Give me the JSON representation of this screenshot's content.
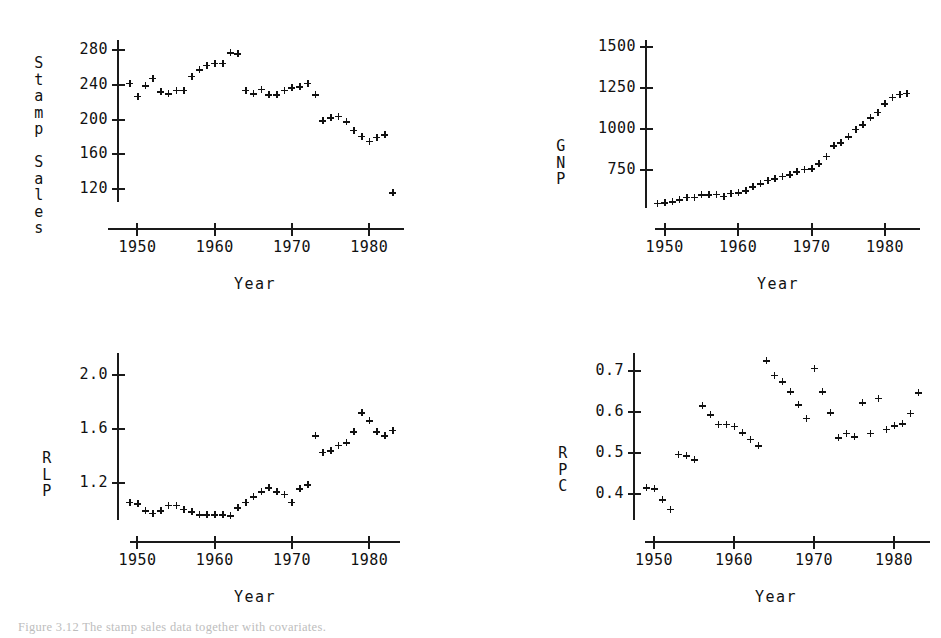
{
  "figure": {
    "caption": "Figure 3.12  The stamp sales data together with covariates.",
    "background_color": "#ffffff",
    "marker_color": "#111111",
    "axis_color": "#1a1a1a"
  },
  "chart_data": [
    {
      "id": "stamp-sales",
      "type": "scatter",
      "title": "",
      "xlabel": "Year",
      "ylabel": "Stamp Sales",
      "ylabel_chars": [
        "S",
        "t",
        "a",
        "m",
        "p",
        "",
        "S",
        "a",
        "l",
        "e",
        "s"
      ],
      "xlim": [
        1948.0,
        1984.5
      ],
      "ylim": [
        105,
        292
      ],
      "xticks": [
        1950,
        1960,
        1970,
        1980
      ],
      "xtick_labels": [
        "1950",
        "1960",
        "1970",
        "1980"
      ],
      "yticks": [
        120,
        160,
        200,
        240,
        280
      ],
      "ytick_labels": [
        "120",
        "160",
        "200",
        "240",
        "280"
      ],
      "grid": false,
      "legend": false,
      "x": [
        1949,
        1950,
        1951,
        1952,
        1953,
        1954,
        1955,
        1956,
        1957,
        1958,
        1959,
        1960,
        1961,
        1962,
        1963,
        1964,
        1965,
        1966,
        1967,
        1968,
        1969,
        1970,
        1971,
        1972,
        1973,
        1974,
        1975,
        1976,
        1977,
        1978,
        1979,
        1980,
        1981,
        1982,
        1983
      ],
      "y": [
        242,
        227,
        239,
        248,
        232,
        230,
        234,
        234,
        250,
        258,
        263,
        265,
        265,
        277,
        276,
        234,
        230,
        235,
        229,
        229,
        234,
        237,
        238,
        242,
        229,
        199,
        202,
        204,
        198,
        188,
        181,
        175,
        180,
        183,
        116
      ],
      "series_note": "one series, single marker style (plus)"
    },
    {
      "id": "gnp",
      "type": "scatter",
      "title": "",
      "xlabel": "Year",
      "ylabel": "GNP",
      "ylabel_chars": [
        "G",
        "N",
        "P"
      ],
      "xlim": [
        1948.0,
        1984.5
      ],
      "ylim": [
        520,
        1545
      ],
      "xticks": [
        1950,
        1960,
        1970,
        1980
      ],
      "xtick_labels": [
        "1950",
        "1960",
        "1970",
        "1980"
      ],
      "yticks": [
        750,
        1000,
        1250,
        1500
      ],
      "ytick_labels": [
        "750",
        "1000",
        "1250",
        "1500"
      ],
      "grid": false,
      "legend": false,
      "x": [
        1949,
        1950,
        1951,
        1952,
        1953,
        1954,
        1955,
        1956,
        1957,
        1958,
        1959,
        1960,
        1961,
        1962,
        1963,
        1964,
        1965,
        1966,
        1967,
        1968,
        1969,
        1970,
        1971,
        1972,
        1973,
        1974,
        1975,
        1976,
        1977,
        1978,
        1979,
        1980,
        1981,
        1982,
        1983
      ],
      "y": [
        550,
        552,
        560,
        570,
        585,
        585,
        600,
        600,
        603,
        592,
        610,
        612,
        625,
        650,
        668,
        690,
        700,
        715,
        722,
        740,
        757,
        760,
        790,
        835,
        900,
        920,
        955,
        1000,
        1030,
        1070,
        1105,
        1155,
        1195,
        1215,
        1220
      ]
    },
    {
      "id": "rlp",
      "type": "scatter",
      "title": "",
      "xlabel": "Year",
      "ylabel": "RLP",
      "ylabel_chars": [
        "R",
        "L",
        "P"
      ],
      "xlim": [
        1948.0,
        1984.5
      ],
      "ylim": [
        0.93,
        2.16
      ],
      "xticks": [
        1950,
        1960,
        1970,
        1980
      ],
      "xtick_labels": [
        "1950",
        "1960",
        "1970",
        "1980"
      ],
      "yticks": [
        1.2,
        1.6,
        2.0
      ],
      "ytick_labels": [
        "1.2",
        "1.6",
        "2.0"
      ],
      "grid": false,
      "legend": false,
      "x": [
        1949,
        1950,
        1951,
        1952,
        1953,
        1954,
        1955,
        1956,
        1957,
        1958,
        1959,
        1960,
        1961,
        1962,
        1963,
        1964,
        1965,
        1966,
        1967,
        1968,
        1969,
        1970,
        1971,
        1972,
        1973,
        1974,
        1975,
        1976,
        1977,
        1978,
        1979,
        1980,
        1981,
        1982,
        1983
      ],
      "y": [
        1.06,
        1.05,
        1.0,
        0.98,
        1.0,
        1.04,
        1.04,
        1.01,
        0.99,
        0.97,
        0.97,
        0.97,
        0.97,
        0.96,
        1.02,
        1.06,
        1.1,
        1.14,
        1.17,
        1.14,
        1.12,
        1.06,
        1.16,
        1.19,
        1.55,
        1.43,
        1.44,
        1.48,
        1.5,
        1.58,
        1.72,
        1.66,
        1.58,
        1.55,
        1.59
      ]
    },
    {
      "id": "rpc",
      "type": "scatter",
      "title": "",
      "xlabel": "Year",
      "ylabel": "RPC",
      "ylabel_chars": [
        "R",
        "P",
        "C"
      ],
      "xlim": [
        1948.0,
        1984.5
      ],
      "ylim": [
        0.335,
        0.745
      ],
      "xticks": [
        1950,
        1960,
        1970,
        1980
      ],
      "xtick_labels": [
        "1950",
        "1960",
        "1970",
        "1980"
      ],
      "yticks": [
        0.4,
        0.5,
        0.6,
        0.7
      ],
      "ytick_labels": [
        "0.4",
        "0.5",
        "0.6",
        "0.7"
      ],
      "grid": false,
      "legend": false,
      "x": [
        1949,
        1950,
        1951,
        1952,
        1953,
        1954,
        1955,
        1956,
        1957,
        1958,
        1959,
        1960,
        1961,
        1962,
        1963,
        1964,
        1965,
        1966,
        1967,
        1968,
        1969,
        1970,
        1971,
        1972,
        1973,
        1974,
        1975,
        1976,
        1977,
        1978,
        1979,
        1980,
        1981,
        1982,
        1983
      ],
      "y": [
        0.415,
        0.412,
        0.385,
        0.362,
        0.497,
        0.493,
        0.483,
        0.615,
        0.594,
        0.57,
        0.57,
        0.565,
        0.549,
        0.533,
        0.518,
        0.726,
        0.69,
        0.675,
        0.65,
        0.618,
        0.585,
        0.708,
        0.65,
        0.598,
        0.537,
        0.548,
        0.54,
        0.623,
        0.548,
        0.634,
        0.558,
        0.566,
        0.572,
        0.597,
        0.648
      ]
    }
  ],
  "panels": [
    {
      "id": "stamp-sales",
      "name": "stamp-sales-chart"
    },
    {
      "id": "gnp",
      "name": "gnp-chart"
    },
    {
      "id": "rlp",
      "name": "rlp-chart"
    },
    {
      "id": "rpc",
      "name": "rpc-chart"
    }
  ]
}
